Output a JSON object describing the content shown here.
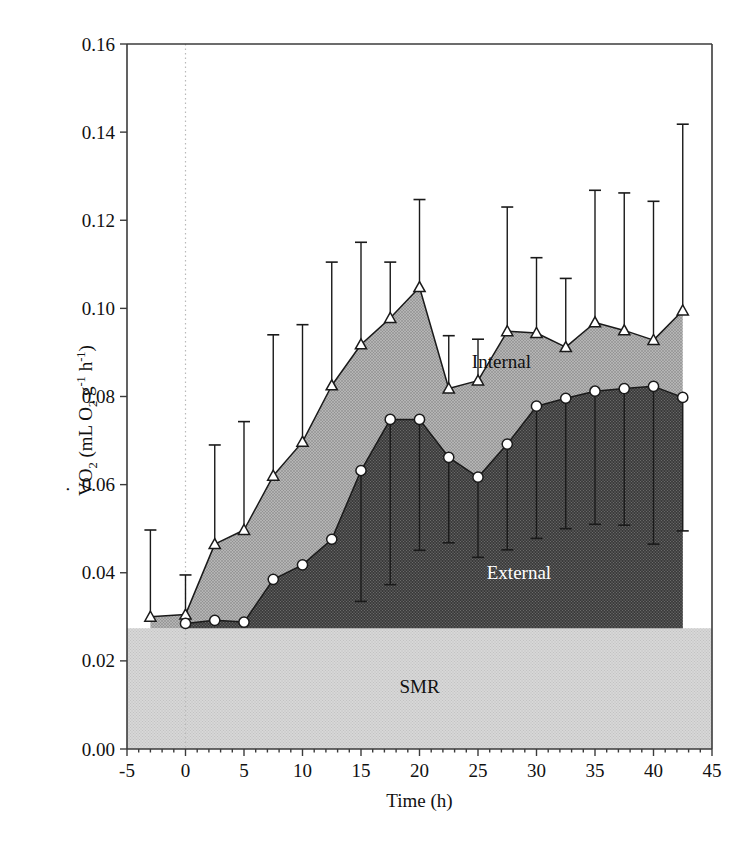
{
  "figure": {
    "background": "#ffffff",
    "plot_area": {
      "left": 127,
      "right": 712,
      "top": 44,
      "bottom": 749
    }
  },
  "axes": {
    "x": {
      "label": "Time (h)",
      "ticks": [
        -5,
        0,
        5,
        10,
        15,
        20,
        25,
        30,
        35,
        40,
        45
      ],
      "tick_labels": [
        "-5",
        "0",
        "5",
        "10",
        "15",
        "20",
        "25",
        "30",
        "35",
        "40",
        "45"
      ],
      "min": -5,
      "max": 45
    },
    "y": {
      "label_parts": {
        "v": "V",
        "o": "O",
        "o_sub": "2",
        "open": " (mL O",
        "o2_sub": "2",
        "g": " g",
        "g_sup": "-1",
        "h": " h",
        "h_sup": "-1",
        "close": ")"
      },
      "label_plain": "VO2 (mL O2 g-1 h-1)",
      "ticks": [
        0.0,
        0.02,
        0.04,
        0.06,
        0.08,
        0.1,
        0.12,
        0.14,
        0.16
      ],
      "tick_labels": [
        "0.00",
        "0.02",
        "0.04",
        "0.06",
        "0.08",
        "0.10",
        "0.12",
        "0.14",
        "0.16"
      ],
      "min": 0.0,
      "max": 0.16
    }
  },
  "region_labels": [
    {
      "text": "Internal",
      "x": 27.0,
      "y": 0.0865,
      "style": "light"
    },
    {
      "text": "External",
      "x": 28.5,
      "y": 0.0385,
      "style": "dark"
    },
    {
      "text": "SMR",
      "x": 20.0,
      "y": 0.0128,
      "style": "light"
    }
  ],
  "colors": {
    "smr_fill": "#d4d4d4",
    "internal_fill": "#bdbdbd",
    "external_fill": "#3d3d3d",
    "line": "#1a1a1a",
    "axis": "#3b3b3b",
    "zero_guide": "#b9b9b9",
    "marker_face": "#ffffff"
  },
  "chart_data": {
    "type": "area",
    "title": "",
    "xlabel": "Time (h)",
    "ylabel": "VO2 (mL O2 g-1 h-1)",
    "xlim": [
      -5,
      45
    ],
    "ylim": [
      0.0,
      0.16
    ],
    "grid": false,
    "legend": "in-plot region labels",
    "baseline": {
      "name": "SMR",
      "value": 0.0274,
      "note": "standard metabolic rate band fill from 0 to 0.0274"
    },
    "zero_guide_x": 0,
    "series": [
      {
        "name": "Internal",
        "marker": "triangle-up-open",
        "x": [
          -3.0,
          0.0,
          2.5,
          5.0,
          7.5,
          10.0,
          12.5,
          15.0,
          17.5,
          20.0,
          22.5,
          25.0,
          27.5,
          30.0,
          32.5,
          35.0,
          37.5,
          40.0,
          42.5
        ],
        "y": [
          0.03,
          0.0305,
          0.0465,
          0.0497,
          0.062,
          0.0697,
          0.0825,
          0.0918,
          0.0978,
          0.1048,
          0.0818,
          0.0836,
          0.0948,
          0.0944,
          0.0912,
          0.0968,
          0.095,
          0.0928,
          0.0995
        ],
        "err_upper": [
          0.0497,
          0.0395,
          0.069,
          0.0743,
          0.094,
          0.0963,
          0.1105,
          0.115,
          0.1105,
          0.1247,
          0.0938,
          0.093,
          0.123,
          0.1115,
          0.1068,
          0.1268,
          0.1262,
          0.1243,
          0.1418
        ]
      },
      {
        "name": "External",
        "marker": "circle-open",
        "x": [
          0.0,
          2.5,
          5.0,
          7.5,
          10.0,
          12.5,
          15.0,
          17.5,
          20.0,
          22.5,
          25.0,
          27.5,
          30.0,
          32.5,
          35.0,
          37.5,
          40.0,
          42.5
        ],
        "y": [
          0.0285,
          0.0292,
          0.0288,
          0.0385,
          0.0418,
          0.0476,
          0.0632,
          0.0748,
          0.0748,
          0.0662,
          0.0617,
          0.0692,
          0.0778,
          0.0796,
          0.0812,
          0.0818,
          0.0823,
          0.0798
        ],
        "err_lower": [
          0.0285,
          0.0292,
          0.0288,
          0.0385,
          0.0418,
          0.0476,
          0.0335,
          0.0373,
          0.0451,
          0.0468,
          0.0435,
          0.0452,
          0.0478,
          0.05,
          0.051,
          0.0508,
          0.0465,
          0.0495
        ]
      }
    ]
  }
}
